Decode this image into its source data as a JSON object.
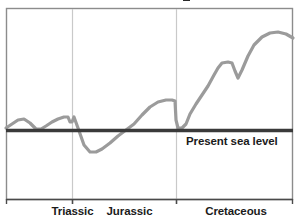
{
  "figure": {
    "kind": "sea-level-curve-chart",
    "background_color": "#ffffff",
    "frame_color": "#8c8c8c",
    "annotations": {
      "sea_level_label": "Present sea level"
    },
    "title_remnant": ""
  },
  "chart_data": {
    "type": "line",
    "title": "",
    "xlabel": "",
    "ylabel": "",
    "grid": false,
    "legend": null,
    "curve_color": "#9b9b9b",
    "curve_width": 3.2,
    "baseline": {
      "label": "Present sea level",
      "value": 0,
      "color": "#3a3a3a",
      "width": 3.4
    },
    "categories": [
      "Triassic",
      "Jurassic",
      "Cretaceous"
    ],
    "category_boundaries_px": [
      6,
      72,
      176,
      293
    ],
    "axis_ranges": {
      "x_px": [
        6,
        293
      ],
      "y_px": [
        8,
        200
      ],
      "sea_level_y_px": 130
    },
    "x": [
      6,
      12,
      18,
      24,
      30,
      36,
      41,
      46,
      52,
      58,
      64,
      68,
      70,
      72,
      74,
      78,
      84,
      90,
      96,
      102,
      110,
      118,
      126,
      134,
      142,
      150,
      158,
      166,
      172,
      175,
      176,
      178,
      182,
      186,
      190,
      196,
      202,
      208,
      214,
      218,
      222,
      228,
      232,
      235,
      238,
      242,
      248,
      254,
      262,
      270,
      278,
      286,
      293
    ],
    "y_px": [
      128,
      124,
      120,
      119,
      123,
      129,
      129,
      126,
      122,
      119,
      117,
      117,
      122,
      122,
      117,
      128,
      145,
      152,
      152,
      149,
      143,
      136,
      130,
      124,
      115,
      107,
      102,
      100,
      100,
      101,
      120,
      128,
      128,
      124,
      114,
      104,
      95,
      86,
      75,
      68,
      63,
      62,
      63,
      71,
      78,
      70,
      56,
      45,
      37,
      33,
      32,
      34,
      38
    ],
    "series_description": "Relative sea level through Triassic, Jurassic and Cretaceous periods, plotted against present sea level",
    "notable_features": [
      {
        "name": "early-triassic-bump",
        "x_px": 24,
        "above_sea_level": true
      },
      {
        "name": "late-triassic-plateau",
        "x_px": 66,
        "above_sea_level": true
      },
      {
        "name": "early-jurassic-lowstand",
        "x_px": 92,
        "above_sea_level": false
      },
      {
        "name": "sea-level-crossing",
        "x_px": 126,
        "above_sea_level": true
      },
      {
        "name": "late-jurassic-plateau",
        "x_px": 168,
        "above_sea_level": true
      },
      {
        "name": "jurassic-cretaceous-drop",
        "x_px": 176,
        "above_sea_level": true
      },
      {
        "name": "mid-cretaceous-step",
        "x_px": 224,
        "above_sea_level": true
      },
      {
        "name": "mid-cretaceous-notch",
        "x_px": 236,
        "above_sea_level": true
      },
      {
        "name": "late-cretaceous-highstand",
        "x_px": 278,
        "above_sea_level": true
      }
    ]
  },
  "axis": {
    "ticks": [
      {
        "x_px": 6,
        "name": "tick-left-edge"
      },
      {
        "x_px": 72,
        "name": "tick-triassic-jurassic"
      },
      {
        "x_px": 176,
        "name": "tick-jurassic-cretaceous"
      },
      {
        "x_px": 293,
        "name": "tick-right-edge"
      }
    ],
    "labels": [
      {
        "text": "Triassic"
      },
      {
        "text": "Jurassic"
      },
      {
        "text": "Cretaceous"
      }
    ]
  }
}
